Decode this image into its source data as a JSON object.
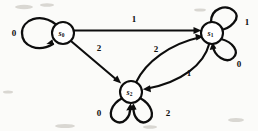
{
  "diagram": {
    "kind": "finite-state-automaton",
    "title": "",
    "background_color": "#fbfbf9",
    "ink_color": "#0d0d0d",
    "states": [
      {
        "id": "s0",
        "label": "s",
        "subscript": "0",
        "cx": 63,
        "cy": 33,
        "r": 11
      },
      {
        "id": "s1",
        "label": "s",
        "subscript": "1",
        "cx": 212,
        "cy": 33,
        "r": 11
      },
      {
        "id": "s2",
        "label": "s",
        "subscript": "2",
        "cx": 131,
        "cy": 92,
        "r": 11
      }
    ],
    "transitions": [
      {
        "id": "t-s0-s0",
        "from": "s0",
        "to": "s0",
        "symbol": "0",
        "kind": "self-loop",
        "label_x": 14,
        "label_y": 33
      },
      {
        "id": "t-s0-s1",
        "from": "s0",
        "to": "s1",
        "symbol": "1",
        "kind": "straight",
        "label_x": 134,
        "label_y": 19
      },
      {
        "id": "t-s0-s2",
        "from": "s0",
        "to": "s2",
        "symbol": "2",
        "kind": "straight",
        "label_x": 99,
        "label_y": 48
      },
      {
        "id": "t-s2-s1",
        "from": "s2",
        "to": "s1",
        "symbol": "2",
        "kind": "curve",
        "label_x": 156,
        "label_y": 49
      },
      {
        "id": "t-s1-s2",
        "from": "s1",
        "to": "s2",
        "symbol": "1",
        "kind": "curve",
        "label_x": 189,
        "label_y": 73
      },
      {
        "id": "t-s1-s1-a",
        "from": "s1",
        "to": "s1",
        "symbol": "1",
        "kind": "self-loop",
        "label_x": 247,
        "label_y": 22
      },
      {
        "id": "t-s1-s1-b",
        "from": "s1",
        "to": "s1",
        "symbol": "0",
        "kind": "self-loop",
        "label_x": 239,
        "label_y": 64
      },
      {
        "id": "t-s2-s2-a",
        "from": "s2",
        "to": "s2",
        "symbol": "0",
        "kind": "self-loop",
        "label_x": 99,
        "label_y": 113
      },
      {
        "id": "t-s2-s2-b",
        "from": "s2",
        "to": "s2",
        "symbol": "2",
        "kind": "self-loop",
        "label_x": 168,
        "label_y": 113
      }
    ]
  }
}
